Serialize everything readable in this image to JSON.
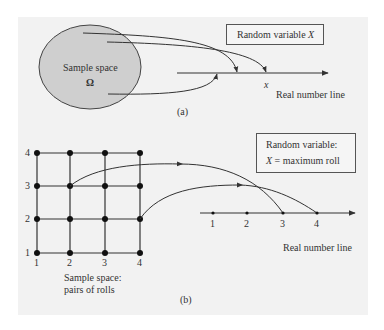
{
  "panel_a": {
    "ellipse_label_line1": "Sample space",
    "ellipse_label_line2": "Ω",
    "box_label_prefix": "Random variable ",
    "box_label_var": "X",
    "point_label": "x",
    "axis_label": "Real number line",
    "caption": "(a)"
  },
  "panel_b": {
    "grid_y_labels": [
      "4",
      "3",
      "2",
      "1"
    ],
    "grid_x_labels": [
      "1",
      "2",
      "3",
      "4"
    ],
    "grid_caption_line1": "Sample space:",
    "grid_caption_line2": "pairs of rolls",
    "box_line1": "Random variable:",
    "box_line2_var": "X",
    "box_line2_rest": " = maximum roll",
    "axis_ticks": [
      "1",
      "2",
      "3",
      "4"
    ],
    "axis_label": "Real number line",
    "caption": "(b)"
  },
  "colors": {
    "panel_bg": "#f2f2f2",
    "ellipse_fill": "#cfcfcf",
    "stroke": "#333333"
  }
}
